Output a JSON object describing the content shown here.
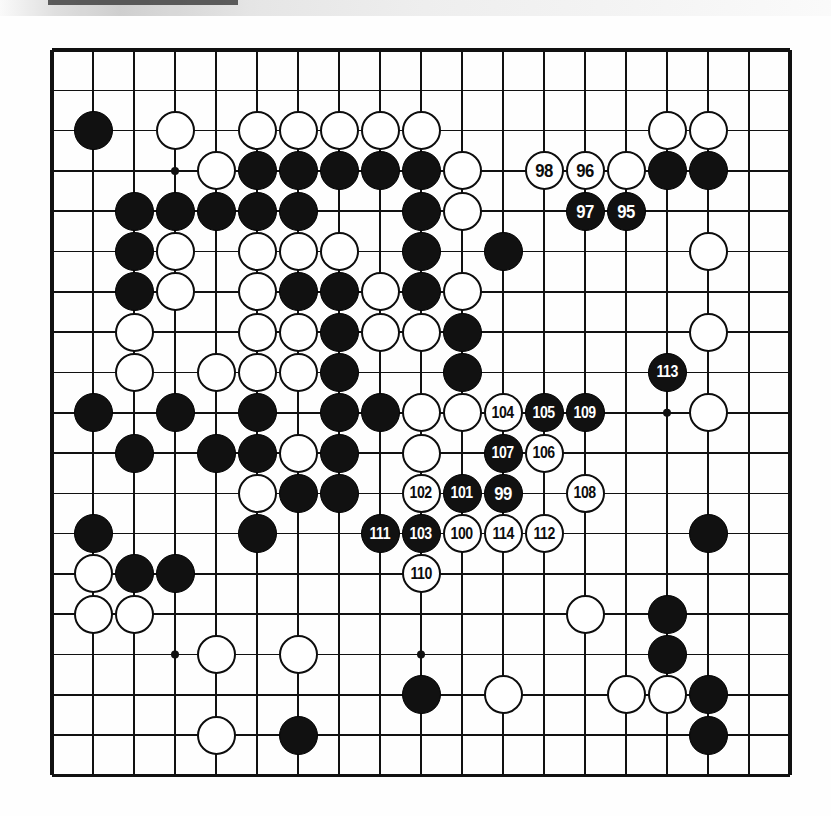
{
  "diagram": {
    "kind": "go-board-diagram",
    "board_size": 19,
    "geometry": {
      "origin_x": 52,
      "origin_y": 50,
      "cell": 41,
      "cell_y": 40.3,
      "stone_radius": 19.5,
      "line_color": "#111111",
      "border_width": 3.2,
      "line_width": 1.6,
      "black_color": "#111111",
      "white_color": "#ffffff",
      "background": "#fefefe"
    },
    "star_points": [
      {
        "col": 3,
        "row": 3
      },
      {
        "col": 9,
        "row": 3
      },
      {
        "col": 15,
        "row": 3
      },
      {
        "col": 3,
        "row": 9
      },
      {
        "col": 9,
        "row": 9
      },
      {
        "col": 15,
        "row": 9
      },
      {
        "col": 3,
        "row": 15
      },
      {
        "col": 9,
        "row": 15
      },
      {
        "col": 15,
        "row": 15
      }
    ],
    "stones": [
      {
        "col": 1,
        "row": 2,
        "color": "black",
        "label": ""
      },
      {
        "col": 3,
        "row": 2,
        "color": "white",
        "label": ""
      },
      {
        "col": 5,
        "row": 2,
        "color": "white",
        "label": ""
      },
      {
        "col": 6,
        "row": 2,
        "color": "white",
        "label": ""
      },
      {
        "col": 7,
        "row": 2,
        "color": "white",
        "label": ""
      },
      {
        "col": 8,
        "row": 2,
        "color": "white",
        "label": ""
      },
      {
        "col": 9,
        "row": 2,
        "color": "white",
        "label": ""
      },
      {
        "col": 15,
        "row": 2,
        "color": "white",
        "label": ""
      },
      {
        "col": 16,
        "row": 2,
        "color": "white",
        "label": ""
      },
      {
        "col": 4,
        "row": 3,
        "color": "white",
        "label": ""
      },
      {
        "col": 5,
        "row": 3,
        "color": "black",
        "label": ""
      },
      {
        "col": 6,
        "row": 3,
        "color": "black",
        "label": ""
      },
      {
        "col": 7,
        "row": 3,
        "color": "black",
        "label": ""
      },
      {
        "col": 8,
        "row": 3,
        "color": "black",
        "label": ""
      },
      {
        "col": 9,
        "row": 3,
        "color": "black",
        "label": ""
      },
      {
        "col": 10,
        "row": 3,
        "color": "white",
        "label": ""
      },
      {
        "col": 12,
        "row": 3,
        "color": "white",
        "label": "98"
      },
      {
        "col": 13,
        "row": 3,
        "color": "white",
        "label": "96"
      },
      {
        "col": 14,
        "row": 3,
        "color": "white",
        "label": ""
      },
      {
        "col": 15,
        "row": 3,
        "color": "black",
        "label": ""
      },
      {
        "col": 16,
        "row": 3,
        "color": "black",
        "label": ""
      },
      {
        "col": 2,
        "row": 4,
        "color": "black",
        "label": ""
      },
      {
        "col": 3,
        "row": 4,
        "color": "black",
        "label": ""
      },
      {
        "col": 4,
        "row": 4,
        "color": "black",
        "label": ""
      },
      {
        "col": 5,
        "row": 4,
        "color": "black",
        "label": ""
      },
      {
        "col": 6,
        "row": 4,
        "color": "black",
        "label": ""
      },
      {
        "col": 9,
        "row": 4,
        "color": "black",
        "label": ""
      },
      {
        "col": 10,
        "row": 4,
        "color": "white",
        "label": ""
      },
      {
        "col": 13,
        "row": 4,
        "color": "black",
        "label": "97"
      },
      {
        "col": 14,
        "row": 4,
        "color": "black",
        "label": "95"
      },
      {
        "col": 2,
        "row": 5,
        "color": "black",
        "label": ""
      },
      {
        "col": 3,
        "row": 5,
        "color": "white",
        "label": ""
      },
      {
        "col": 5,
        "row": 5,
        "color": "white",
        "label": ""
      },
      {
        "col": 6,
        "row": 5,
        "color": "white",
        "label": ""
      },
      {
        "col": 7,
        "row": 5,
        "color": "white",
        "label": ""
      },
      {
        "col": 9,
        "row": 5,
        "color": "black",
        "label": ""
      },
      {
        "col": 11,
        "row": 5,
        "color": "black",
        "label": ""
      },
      {
        "col": 16,
        "row": 5,
        "color": "white",
        "label": ""
      },
      {
        "col": 2,
        "row": 6,
        "color": "black",
        "label": ""
      },
      {
        "col": 3,
        "row": 6,
        "color": "white",
        "label": ""
      },
      {
        "col": 5,
        "row": 6,
        "color": "white",
        "label": ""
      },
      {
        "col": 6,
        "row": 6,
        "color": "black",
        "label": ""
      },
      {
        "col": 7,
        "row": 6,
        "color": "black",
        "label": ""
      },
      {
        "col": 8,
        "row": 6,
        "color": "white",
        "label": ""
      },
      {
        "col": 9,
        "row": 6,
        "color": "black",
        "label": ""
      },
      {
        "col": 10,
        "row": 6,
        "color": "white",
        "label": ""
      },
      {
        "col": 2,
        "row": 7,
        "color": "white",
        "label": ""
      },
      {
        "col": 5,
        "row": 7,
        "color": "white",
        "label": ""
      },
      {
        "col": 6,
        "row": 7,
        "color": "white",
        "label": ""
      },
      {
        "col": 7,
        "row": 7,
        "color": "black",
        "label": ""
      },
      {
        "col": 8,
        "row": 7,
        "color": "white",
        "label": ""
      },
      {
        "col": 9,
        "row": 7,
        "color": "white",
        "label": ""
      },
      {
        "col": 10,
        "row": 7,
        "color": "black",
        "label": ""
      },
      {
        "col": 16,
        "row": 7,
        "color": "white",
        "label": ""
      },
      {
        "col": 2,
        "row": 8,
        "color": "white",
        "label": ""
      },
      {
        "col": 4,
        "row": 8,
        "color": "white",
        "label": ""
      },
      {
        "col": 5,
        "row": 8,
        "color": "white",
        "label": ""
      },
      {
        "col": 6,
        "row": 8,
        "color": "white",
        "label": ""
      },
      {
        "col": 7,
        "row": 8,
        "color": "black",
        "label": ""
      },
      {
        "col": 10,
        "row": 8,
        "color": "black",
        "label": ""
      },
      {
        "col": 15,
        "row": 8,
        "color": "black",
        "label": "113"
      },
      {
        "col": 1,
        "row": 9,
        "color": "black",
        "label": ""
      },
      {
        "col": 3,
        "row": 9,
        "color": "black",
        "label": ""
      },
      {
        "col": 5,
        "row": 9,
        "color": "black",
        "label": ""
      },
      {
        "col": 7,
        "row": 9,
        "color": "black",
        "label": ""
      },
      {
        "col": 8,
        "row": 9,
        "color": "black",
        "label": ""
      },
      {
        "col": 9,
        "row": 9,
        "color": "white",
        "label": ""
      },
      {
        "col": 10,
        "row": 9,
        "color": "white",
        "label": ""
      },
      {
        "col": 11,
        "row": 9,
        "color": "white",
        "label": "104"
      },
      {
        "col": 12,
        "row": 9,
        "color": "black",
        "label": "105"
      },
      {
        "col": 13,
        "row": 9,
        "color": "black",
        "label": "109"
      },
      {
        "col": 16,
        "row": 9,
        "color": "white",
        "label": ""
      },
      {
        "col": 2,
        "row": 10,
        "color": "black",
        "label": ""
      },
      {
        "col": 4,
        "row": 10,
        "color": "black",
        "label": ""
      },
      {
        "col": 5,
        "row": 10,
        "color": "black",
        "label": ""
      },
      {
        "col": 6,
        "row": 10,
        "color": "white",
        "label": ""
      },
      {
        "col": 7,
        "row": 10,
        "color": "black",
        "label": ""
      },
      {
        "col": 9,
        "row": 10,
        "color": "white",
        "label": ""
      },
      {
        "col": 11,
        "row": 10,
        "color": "black",
        "label": "107"
      },
      {
        "col": 12,
        "row": 10,
        "color": "white",
        "label": "106"
      },
      {
        "col": 5,
        "row": 11,
        "color": "white",
        "label": ""
      },
      {
        "col": 6,
        "row": 11,
        "color": "black",
        "label": ""
      },
      {
        "col": 7,
        "row": 11,
        "color": "black",
        "label": ""
      },
      {
        "col": 9,
        "row": 11,
        "color": "white",
        "label": "102"
      },
      {
        "col": 10,
        "row": 11,
        "color": "black",
        "label": "101"
      },
      {
        "col": 11,
        "row": 11,
        "color": "black",
        "label": "99"
      },
      {
        "col": 13,
        "row": 11,
        "color": "white",
        "label": "108"
      },
      {
        "col": 1,
        "row": 12,
        "color": "black",
        "label": ""
      },
      {
        "col": 5,
        "row": 12,
        "color": "black",
        "label": ""
      },
      {
        "col": 8,
        "row": 12,
        "color": "black",
        "label": "111"
      },
      {
        "col": 9,
        "row": 12,
        "color": "black",
        "label": "103"
      },
      {
        "col": 10,
        "row": 12,
        "color": "white",
        "label": "100"
      },
      {
        "col": 11,
        "row": 12,
        "color": "white",
        "label": "114"
      },
      {
        "col": 12,
        "row": 12,
        "color": "white",
        "label": "112"
      },
      {
        "col": 16,
        "row": 12,
        "color": "black",
        "label": ""
      },
      {
        "col": 1,
        "row": 13,
        "color": "white",
        "label": ""
      },
      {
        "col": 2,
        "row": 13,
        "color": "black",
        "label": ""
      },
      {
        "col": 3,
        "row": 13,
        "color": "black",
        "label": ""
      },
      {
        "col": 9,
        "row": 13,
        "color": "white",
        "label": "110"
      },
      {
        "col": 1,
        "row": 14,
        "color": "white",
        "label": ""
      },
      {
        "col": 2,
        "row": 14,
        "color": "white",
        "label": ""
      },
      {
        "col": 13,
        "row": 14,
        "color": "white",
        "label": ""
      },
      {
        "col": 15,
        "row": 14,
        "color": "black",
        "label": ""
      },
      {
        "col": 4,
        "row": 15,
        "color": "white",
        "label": ""
      },
      {
        "col": 6,
        "row": 15,
        "color": "white",
        "label": ""
      },
      {
        "col": 15,
        "row": 15,
        "color": "black",
        "label": ""
      },
      {
        "col": 9,
        "row": 16,
        "color": "black",
        "label": ""
      },
      {
        "col": 11,
        "row": 16,
        "color": "white",
        "label": ""
      },
      {
        "col": 14,
        "row": 16,
        "color": "white",
        "label": ""
      },
      {
        "col": 15,
        "row": 16,
        "color": "white",
        "label": ""
      },
      {
        "col": 16,
        "row": 16,
        "color": "black",
        "label": ""
      },
      {
        "col": 4,
        "row": 17,
        "color": "white",
        "label": ""
      },
      {
        "col": 6,
        "row": 17,
        "color": "black",
        "label": ""
      },
      {
        "col": 16,
        "row": 17,
        "color": "black",
        "label": ""
      }
    ],
    "move_numbers": [
      "95",
      "96",
      "97",
      "98",
      "99",
      "100",
      "101",
      "102",
      "103",
      "104",
      "105",
      "106",
      "107",
      "108",
      "109",
      "110",
      "111",
      "112",
      "113",
      "114"
    ]
  }
}
